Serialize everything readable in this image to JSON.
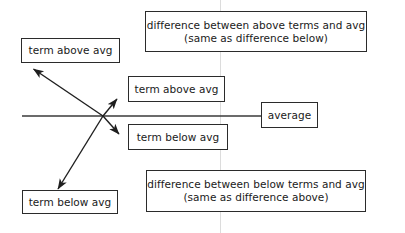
{
  "diagram": {
    "background_color": "#ffffff",
    "stroke_color": "#2b2b2b",
    "guide_line_color": "#d8d8d8",
    "boxes": {
      "term_above_left": "term above avg",
      "difference_above": "difference between above terms and avg\n(same as difference below)",
      "term_above_mid": "term above avg",
      "average": "average",
      "term_below_mid": "term below avg",
      "term_below_left": "term below avg",
      "difference_below": "difference between below terms and avg\n(same as difference above)"
    },
    "lines": {
      "average_line_label": "average-horizontal-line",
      "arrow_up_left_label": "arrow-to-term-above-left",
      "arrow_up_right_label": "arrow-to-term-above-mid",
      "arrow_down_right_label": "arrow-to-term-below-mid",
      "arrow_down_left_label": "arrow-to-term-below-left",
      "guide_label": "vertical-guide-line"
    }
  }
}
